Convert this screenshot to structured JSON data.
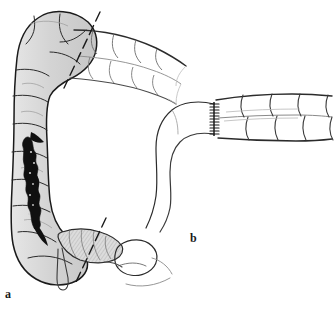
{
  "figure": {
    "type": "medical-illustration",
    "background_color": "#ffffff",
    "ink_color": "#1a1a1a",
    "diseased_fill_color": "#d6d6d6",
    "lesion_color": "#101010",
    "normal_fill_color": "#ffffff",
    "faint_line_color": "#9a9a9a"
  },
  "panels": [
    {
      "id": "a",
      "label": "a",
      "label_x": 5,
      "label_y": 288,
      "caption": "Diseased colon segment with proposed lines of transection",
      "structures": [
        {
          "name": "splenic-flexure",
          "shaded": true
        },
        {
          "name": "descending-colon",
          "shaded": true
        },
        {
          "name": "sigmoid-colon",
          "shaded": true
        },
        {
          "name": "cecum",
          "shaded": true
        },
        {
          "name": "lesion",
          "shaded": true,
          "fill": "#101010"
        },
        {
          "name": "transverse-colon",
          "shaded": false
        },
        {
          "name": "appendix",
          "shaded": false
        },
        {
          "name": "terminal-ileum",
          "shaded": false
        }
      ],
      "transection_lines": [
        {
          "name": "proximal-transection-line",
          "style": "dashed",
          "x1": 100,
          "y1": 12,
          "x2": 64,
          "y2": 88
        },
        {
          "name": "distal-transection-line",
          "style": "dashed",
          "x1": 106,
          "y1": 218,
          "x2": 76,
          "y2": 282
        }
      ]
    },
    {
      "id": "b",
      "label": "b",
      "label_x": 190,
      "label_y": 232,
      "caption": "Completed end-to-end anastomosis between ileum and colon",
      "structures": [
        {
          "name": "anastomosis-suture-line",
          "shaded": false
        },
        {
          "name": "colon-remnant",
          "shaded": false
        },
        {
          "name": "ileum-remnant",
          "shaded": false
        }
      ],
      "suture_count": 11
    }
  ]
}
